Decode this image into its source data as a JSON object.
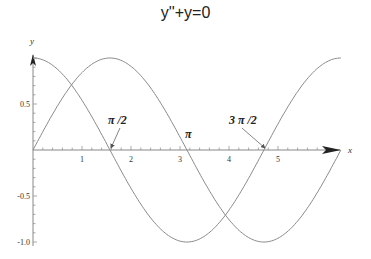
{
  "chart_data": {
    "type": "line",
    "title": "y''+y=0",
    "xlabel": "x",
    "ylabel": "y",
    "xlim": [
      0,
      6.2832
    ],
    "ylim": [
      -1,
      1
    ],
    "grid": false,
    "x_ticks": [
      1,
      2,
      3,
      4,
      5
    ],
    "x_tick_labels": [
      "1",
      "2",
      "3",
      "4",
      "5"
    ],
    "y_ticks": [
      0.5,
      -0.5,
      -1.0
    ],
    "y_tick_labels": [
      "0.5",
      "-0.5",
      "-1.0"
    ],
    "series": [
      {
        "name": "cos(x)",
        "function": "cos",
        "x_range": [
          0,
          6.2832
        ]
      },
      {
        "name": "sin(x)",
        "function": "sin",
        "x_range": [
          0,
          6.2832
        ]
      }
    ],
    "annotations": [
      {
        "text": "π /2",
        "x": 1.5708,
        "y": 0,
        "arrow": true
      },
      {
        "text": "π",
        "x": 3.1416,
        "y": 0,
        "arrow": false
      },
      {
        "text": "3 π /2",
        "x": 4.7124,
        "y": 0,
        "arrow": true
      }
    ]
  }
}
